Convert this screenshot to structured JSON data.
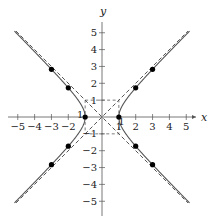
{
  "chart_data": {
    "type": "line",
    "title": "",
    "xlabel": "x",
    "ylabel": "y",
    "xlim": [
      -5.5,
      5.5
    ],
    "ylim": [
      -5.5,
      5.5
    ],
    "grid": false,
    "legend": null,
    "x_ticks": [
      -5,
      -4,
      -3,
      -2,
      1,
      2,
      3,
      4,
      5
    ],
    "x_tick_labels": [
      "−5",
      "−4",
      "−3",
      "−2",
      "1",
      "2",
      "3",
      "4",
      "5"
    ],
    "y_ticks": [
      5,
      4,
      3,
      2,
      1,
      -1,
      -2,
      -3,
      -4,
      -5
    ],
    "y_tick_labels": [
      "5",
      "4",
      "3",
      "2",
      "1",
      "−1",
      "−2",
      "−3",
      "−4",
      "−5"
    ],
    "extra_labels": [
      {
        "text": "1",
        "x": -1.3,
        "y": -0.05
      },
      {
        "text": "1",
        "x": 1.15,
        "y": -0.5
      }
    ],
    "series": [
      {
        "name": "hyperbola x^2 - y^2 = 1 (right branch)",
        "style": "solid",
        "equation": "x = sqrt(1 + y^2)",
        "y_range": [
          -5.1,
          5.1
        ]
      },
      {
        "name": "hyperbola x^2 - y^2 = 1 (left branch)",
        "style": "solid",
        "equation": "x = -sqrt(1 + y^2)",
        "y_range": [
          -5.1,
          5.1
        ]
      },
      {
        "name": "asymptote y = x",
        "style": "dashed",
        "x_range": [
          -5.1,
          5.1
        ]
      },
      {
        "name": "asymptote y = -x",
        "style": "dashed",
        "x_range": [
          -5.1,
          5.1
        ]
      },
      {
        "name": "fundamental rectangle",
        "style": "dashed",
        "corners": [
          [
            -1,
            1
          ],
          [
            1,
            1
          ],
          [
            1,
            -1
          ],
          [
            -1,
            -1
          ]
        ]
      }
    ],
    "points": [
      {
        "x": -3,
        "y": 2.83
      },
      {
        "x": -2,
        "y": 1.73
      },
      {
        "x": -1,
        "y": 0
      },
      {
        "x": -2,
        "y": -1.73
      },
      {
        "x": -3,
        "y": -2.83
      },
      {
        "x": 3,
        "y": 2.83
      },
      {
        "x": 2,
        "y": 1.73
      },
      {
        "x": 1,
        "y": 0
      },
      {
        "x": 2,
        "y": -1.73
      },
      {
        "x": 3,
        "y": -2.83
      }
    ]
  },
  "colors": {
    "axis": "#555555",
    "curve": "#555555",
    "asymptote": "#444444",
    "point": "#000000"
  }
}
